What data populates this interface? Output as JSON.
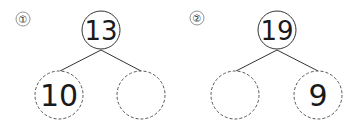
{
  "problems": [
    {
      "label": "①",
      "top": "13",
      "left": "10",
      "right": "",
      "geom": {
        "lx": 23,
        "ly": 19,
        "tx": 101,
        "ty": 30,
        "ax": 59,
        "ay": 95,
        "bx": 141,
        "by": 95
      }
    },
    {
      "label": "②",
      "top": "19",
      "left": "",
      "right": "9",
      "geom": {
        "lx": 197,
        "ly": 18,
        "tx": 277,
        "ty": 30,
        "ax": 235,
        "ay": 95,
        "bx": 318,
        "by": 95
      }
    }
  ],
  "colors": {
    "stroke": "#333333",
    "dashed": "#555555",
    "text": "#1a1a1a"
  }
}
